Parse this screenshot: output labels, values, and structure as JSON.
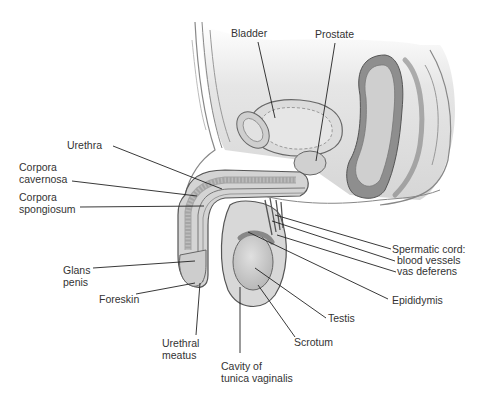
{
  "diagram": {
    "colors": {
      "tissue": "#d4d4d4",
      "tissue_dark": "#a8a8a8",
      "outline": "#555555",
      "background": "#ffffff",
      "text": "#333333",
      "leader": "#222222"
    },
    "labels": {
      "bladder": "Bladder",
      "prostate": "Prostate",
      "urethra": "Urethra",
      "corpora_cavernosa": "Corpora\ncavernosa",
      "corpora_spongiosum": "Corpora\nspongiosum",
      "glans_penis": "Glans\npenis",
      "foreskin": "Foreskin",
      "urethral_meatus": "Urethral\nmeatus",
      "cavity_tunica": "Cavity of\ntunica vaginalis",
      "scrotum": "Scrotum",
      "testis": "Testis",
      "epididymis": "Epididymis",
      "spermatic_cord": "Spermatic cord:",
      "blood_vessels": "blood vessels",
      "vas_deferens": "vas deferens"
    }
  }
}
